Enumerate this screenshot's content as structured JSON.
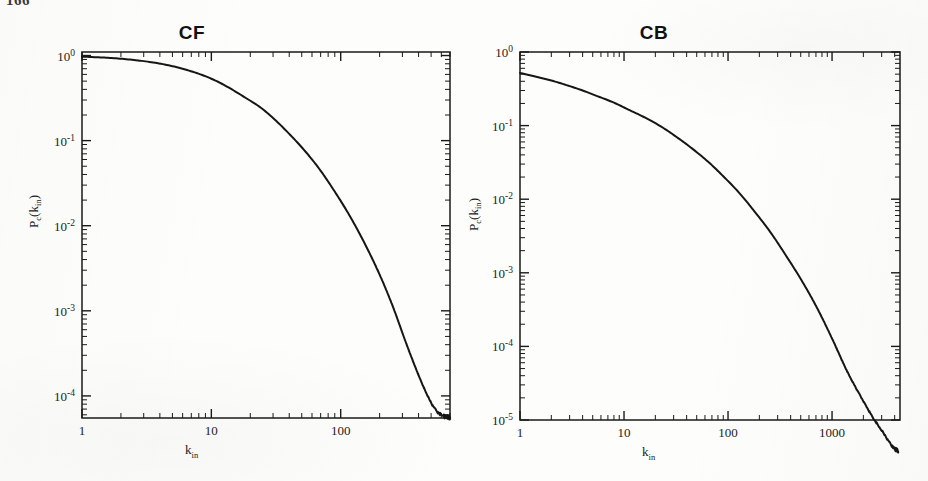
{
  "figure": {
    "page_number": "166",
    "background_color": "#fdfdfb",
    "ink_color": "#1a1a1a",
    "curve_color": "#161616"
  },
  "panels": [
    {
      "id": "cf",
      "title": "CF",
      "xlabel_main": "k",
      "xlabel_sub": "in",
      "ylabel_main": "P",
      "ylabel_sub1": "c",
      "ylabel_arg_main": "k",
      "ylabel_arg_sub": "in",
      "ylabel_full": "Pc(kin)",
      "x_tick_labels": [
        "1",
        "10",
        "100"
      ],
      "y_tick_labels": [
        "10^0",
        "10^-1",
        "10^-2",
        "10^-3",
        "10^-4"
      ]
    },
    {
      "id": "cb",
      "title": "CB",
      "xlabel_main": "k",
      "xlabel_sub": "in",
      "ylabel_main": "P",
      "ylabel_sub1": "c",
      "ylabel_arg_main": "k",
      "ylabel_arg_sub": "in",
      "ylabel_full": "Pc(kin)",
      "x_tick_labels": [
        "1",
        "10",
        "100",
        "1000"
      ],
      "y_tick_labels": [
        "10^0",
        "10^-1",
        "10^-2",
        "10^-3",
        "10^-4",
        "10^-5"
      ]
    }
  ],
  "chart_data": [
    {
      "type": "line",
      "title": "CF",
      "xlabel": "k_in",
      "ylabel": "P_c(k_in)",
      "xscale": "log",
      "yscale": "log",
      "xlim": [
        1,
        700
      ],
      "ylim": [
        5.5e-05,
        1.1
      ],
      "xticks": [
        1,
        10,
        100
      ],
      "xtick_labels": [
        "1",
        "10",
        "100"
      ],
      "yticks": [
        1,
        0.1,
        0.01,
        0.001,
        0.0001
      ],
      "ytick_labels": [
        "10^0",
        "10^-1",
        "10^-2",
        "10^-3",
        "10^-4"
      ],
      "grid": false,
      "legend": null,
      "minor_ticks": true,
      "tick_direction": "in",
      "frame": "box",
      "series": [
        {
          "name": "P_c(k_in) CF",
          "x": [
            1,
            1.3,
            1.7,
            2.2,
            2.9,
            3.8,
            5,
            6.5,
            8.5,
            11,
            14,
            18,
            24,
            31,
            40,
            52,
            68,
            88,
            115,
            150,
            195,
            250,
            320,
            400,
            470,
            530,
            580,
            620,
            650,
            675,
            690,
            700
          ],
          "y": [
            0.97,
            0.955,
            0.935,
            0.905,
            0.865,
            0.815,
            0.75,
            0.675,
            0.59,
            0.5,
            0.41,
            0.325,
            0.245,
            0.176,
            0.12,
            0.078,
            0.047,
            0.0265,
            0.0138,
            0.0066,
            0.0029,
            0.00118,
            0.00042,
            0.000175,
            0.0001,
            7.2e-05,
            6.2e-05,
            5.85e-05,
            5.65e-05,
            5.55e-05,
            5.5e-05,
            5.5e-05
          ]
        }
      ]
    },
    {
      "type": "line",
      "title": "CB",
      "xlabel": "k_in",
      "ylabel": "P_c(k_in)",
      "xscale": "log",
      "yscale": "log",
      "xlim": [
        1,
        4500
      ],
      "ylim": [
        1e-05,
        1.0
      ],
      "xticks": [
        1,
        10,
        100,
        1000
      ],
      "xtick_labels": [
        "1",
        "10",
        "100",
        "1000"
      ],
      "yticks": [
        1,
        0.1,
        0.01,
        0.001,
        0.0001,
        1e-05
      ],
      "ytick_labels": [
        "10^0",
        "10^-1",
        "10^-2",
        "10^-3",
        "10^-4",
        "10^-5"
      ],
      "grid": false,
      "legend": null,
      "minor_ticks": true,
      "tick_direction": "in",
      "frame": "box",
      "series": [
        {
          "name": "P_c(k_in) CB",
          "x": [
            1,
            1.4,
            2,
            2.8,
            4,
            5.6,
            8,
            11,
            16,
            23,
            32,
            45,
            64,
            90,
            128,
            180,
            256,
            360,
            512,
            720,
            1000,
            1400,
            1900,
            2500,
            3000,
            3400,
            3700,
            3900,
            4050,
            4150,
            4250,
            4300
          ],
          "y": [
            0.52,
            0.465,
            0.41,
            0.355,
            0.3,
            0.25,
            0.205,
            0.165,
            0.128,
            0.096,
            0.07,
            0.049,
            0.0325,
            0.0205,
            0.0122,
            0.0068,
            0.00355,
            0.00172,
            0.00078,
            0.00033,
            0.000128,
            4.55e-05,
            2.05e-05,
            1.05e-05,
            7.2e-06,
            5.5e-06,
            4.6e-06,
            4.2e-06,
            4e-06,
            3.9e-06,
            3.8e-06,
            3.8e-06
          ]
        }
      ]
    }
  ]
}
